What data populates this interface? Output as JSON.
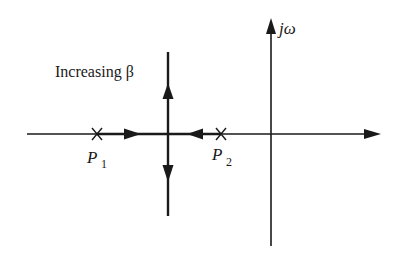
{
  "diagram": {
    "type": "root-locus",
    "colors": {
      "ink": "#1a1a1a",
      "background": "#ffffff"
    },
    "labels": {
      "imag_axis": "jω",
      "annotation": "Increasing β",
      "pole1_main": "P",
      "pole1_sub": "1",
      "pole2_main": "P",
      "pole2_sub": "2"
    },
    "poles": [
      {
        "name": "P1",
        "marker": "cross",
        "x": 97,
        "y": 134
      },
      {
        "name": "P2",
        "marker": "cross",
        "x": 221,
        "y": 134
      }
    ],
    "breakaway_point": {
      "x": 168,
      "y": 134
    },
    "axes": {
      "real": {
        "x_start": 27,
        "x_end": 381,
        "y": 134
      },
      "imag": {
        "x": 271,
        "y_start": 18,
        "y_end": 246
      }
    },
    "locus_branches": [
      {
        "from": "P1",
        "direction": "right",
        "toward": "breakaway"
      },
      {
        "from": "P2",
        "direction": "left",
        "toward": "breakaway"
      },
      {
        "from": "breakaway",
        "direction": "up"
      },
      {
        "from": "breakaway",
        "direction": "down"
      }
    ]
  }
}
